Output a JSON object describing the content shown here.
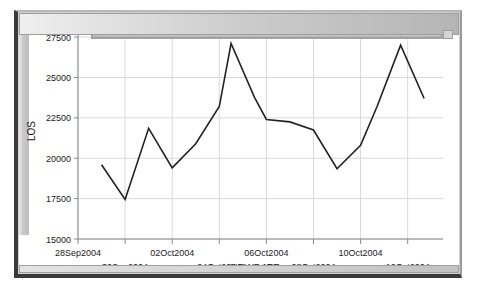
{
  "window": {
    "title": ""
  },
  "scrollbars": {
    "horizontal_name": "horizontal-scrollbar",
    "vertical_name": "vertical-scrollbar"
  },
  "chart_data": {
    "type": "line",
    "title": "",
    "xlabel": "NEWDATE",
    "ylabel": "LOS",
    "grid": true,
    "legend": "none",
    "line_color": "#222222",
    "grid_color": "#d9d9d9",
    "axis_color": "#8a8a8a",
    "xlim": [
      "28Sep2004",
      "12Oct2004"
    ],
    "ylim": [
      15000,
      28000
    ],
    "ytick_labels": [
      "15000",
      "17500",
      "20000",
      "22500",
      "25000",
      "27500"
    ],
    "ytick_values": [
      15000,
      17500,
      20000,
      22500,
      25000,
      27500
    ],
    "xtick_labels": [
      "28Sep2004",
      "30Sep2004",
      "02Oct2004",
      "04Oct2004",
      "06Oct2004",
      "08Oct2004",
      "10Oct2004",
      "12Oct2004"
    ],
    "xtick_days": [
      0,
      2,
      4,
      6,
      8,
      10,
      12,
      14
    ],
    "x": [
      1.0,
      2.0,
      3.0,
      4.0,
      5.0,
      6.0,
      6.5,
      7.5,
      8.0,
      9.0,
      10.0,
      11.0,
      12.0,
      12.7,
      13.7,
      14.7
    ],
    "values": [
      19600,
      17450,
      21850,
      19400,
      20900,
      23200,
      27100,
      23750,
      22400,
      22250,
      21750,
      19350,
      20800,
      23200,
      27000,
      23700
    ],
    "points": [
      {
        "x": 1.0,
        "label": "29Sep2004",
        "y": 19600
      },
      {
        "x": 2.0,
        "label": "30Sep2004",
        "y": 17450
      },
      {
        "x": 3.0,
        "label": "01Oct2004",
        "y": 21850
      },
      {
        "x": 4.0,
        "label": "02Oct2004",
        "y": 19400
      },
      {
        "x": 5.0,
        "label": "03Oct2004",
        "y": 20900
      },
      {
        "x": 6.0,
        "label": "04Oct2004",
        "y": 23200
      },
      {
        "x": 6.5,
        "label": "04Oct2004",
        "y": 27100
      },
      {
        "x": 7.5,
        "label": "05Oct2004",
        "y": 23750
      },
      {
        "x": 8.0,
        "label": "06Oct2004",
        "y": 22400
      },
      {
        "x": 9.0,
        "label": "07Oct2004",
        "y": 22250
      },
      {
        "x": 10.0,
        "label": "08Oct2004",
        "y": 21750
      },
      {
        "x": 11.0,
        "label": "09Oct2004",
        "y": 19350
      },
      {
        "x": 12.0,
        "label": "10Oct2004",
        "y": 20800
      },
      {
        "x": 12.7,
        "label": "10Oct2004",
        "y": 23200
      },
      {
        "x": 13.7,
        "label": "11Oct2004",
        "y": 27000
      },
      {
        "x": 14.7,
        "label": "12Oct2004",
        "y": 23700
      }
    ]
  }
}
